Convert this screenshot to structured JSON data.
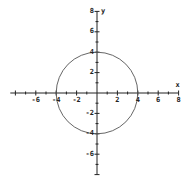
{
  "chart_data": {
    "type": "line",
    "title": "",
    "xlabel": "x",
    "ylabel": "y",
    "xlim": [
      -8.5,
      8
    ],
    "ylim": [
      -8,
      8
    ],
    "grid": false,
    "legend": null,
    "x_ticks": [
      -6,
      -4,
      -2,
      2,
      4,
      6,
      8
    ],
    "y_ticks": [
      8,
      6,
      4,
      2,
      -2,
      -4,
      -6
    ],
    "x_tick_labels": [
      "-6",
      "-4",
      "-2",
      "2",
      "4",
      "6",
      "8"
    ],
    "y_tick_labels": [
      "8",
      "6",
      "4",
      "2",
      "-2",
      "-4",
      "-6"
    ],
    "series": [
      {
        "name": "circle x^2 + y^2 = 16",
        "shape": "circle",
        "center": [
          0,
          0
        ],
        "radius": 4,
        "key_points": [
          [
            4,
            0
          ],
          [
            0,
            4
          ],
          [
            -4,
            0
          ],
          [
            0,
            -4
          ]
        ]
      }
    ],
    "colors": {
      "axis": "#222222",
      "curve": "#555555"
    }
  }
}
